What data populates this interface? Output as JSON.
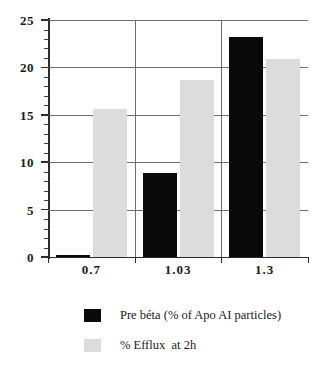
{
  "chart_data": {
    "type": "bar",
    "title": "",
    "subtitle": "",
    "xlabel": "",
    "ylabel": "",
    "categories": [
      "0.7",
      "1.03",
      "1.3"
    ],
    "series": [
      {
        "name": "Pre béta (% of Apo AI particles)",
        "color": "#0a0a0a",
        "values": [
          0.1,
          8.9,
          23.2
        ]
      },
      {
        "name": "% Efflux  at 2h",
        "color": "#dcdcdc",
        "values": [
          15.6,
          18.7,
          20.9
        ]
      }
    ],
    "ylim": [
      0,
      25
    ],
    "y_major_ticks": [
      0,
      5,
      10,
      15,
      20,
      25
    ],
    "y_tick_labels": [
      "0",
      "5",
      "10",
      "15",
      "20",
      "25"
    ],
    "y_minor_tick_step": 1,
    "grid": "horizontal-major",
    "legend_position": "below",
    "axis_color": "#2b2b2b",
    "grid_color": "#6d6d6d",
    "background": "#ffffff"
  },
  "legend": {
    "entries": [
      {
        "label": "Pre béta (% of Apo AI particles)",
        "swatch": "black-swatch"
      },
      {
        "label": "% Efflux  at 2h",
        "swatch": "gray-swatch"
      }
    ]
  }
}
